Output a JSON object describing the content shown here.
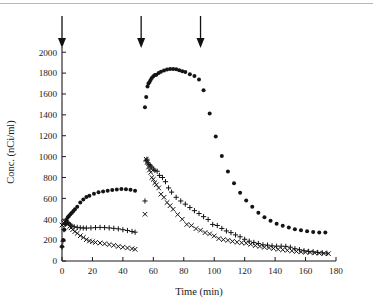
{
  "figure": {
    "kind": "scatter-plot",
    "background_color": "#ffffff",
    "ink_color": "#141414",
    "top_rule_color": "#b8b8b8"
  },
  "chart_data": {
    "type": "scatter",
    "title": "",
    "xlabel": "Time (min)",
    "ylabel": "Conc. (nCi/ml)",
    "xlim": [
      0,
      180
    ],
    "ylim": [
      0,
      2050
    ],
    "xticks": [
      0,
      20,
      40,
      60,
      80,
      100,
      120,
      140,
      160,
      180
    ],
    "yticks": [
      0,
      200,
      400,
      600,
      800,
      1000,
      1200,
      1400,
      1600,
      1800,
      2000
    ],
    "grid": false,
    "legend": "none",
    "annotations": [
      {
        "label": "injection-arrow-1",
        "type": "down-arrow",
        "x": 0
      },
      {
        "label": "injection-arrow-2",
        "type": "down-arrow",
        "x": 52
      },
      {
        "label": "injection-arrow-3",
        "type": "down-arrow",
        "x": 91
      }
    ],
    "series": [
      {
        "name": "filled-circle-series",
        "marker": "filled-circle",
        "points": [
          [
            0,
            140
          ],
          [
            0.8,
            200
          ],
          [
            1.5,
            300
          ],
          [
            2.2,
            355
          ],
          [
            3,
            395
          ],
          [
            3.8,
            420
          ],
          [
            4.6,
            432
          ],
          [
            5.5,
            448
          ],
          [
            6.5,
            462
          ],
          [
            7.5,
            478
          ],
          [
            8.5,
            495
          ],
          [
            10,
            520
          ],
          [
            12,
            560
          ],
          [
            14,
            590
          ],
          [
            16,
            613
          ],
          [
            18,
            625
          ],
          [
            21,
            645
          ],
          [
            24,
            658
          ],
          [
            27,
            665
          ],
          [
            30,
            672
          ],
          [
            33,
            680
          ],
          [
            36,
            686
          ],
          [
            39,
            689
          ],
          [
            42,
            687
          ],
          [
            45,
            682
          ],
          [
            48,
            673
          ],
          [
            54.5,
            1472
          ],
          [
            55.3,
            1572
          ],
          [
            56.2,
            1672
          ],
          [
            56.8,
            1700
          ],
          [
            57.5,
            1715
          ],
          [
            58.2,
            1735
          ],
          [
            59,
            1752
          ],
          [
            60,
            1770
          ],
          [
            61,
            1782
          ],
          [
            62,
            1784
          ],
          [
            63.5,
            1800
          ],
          [
            65,
            1812
          ],
          [
            67,
            1826
          ],
          [
            69,
            1834
          ],
          [
            71,
            1840
          ],
          [
            73,
            1840
          ],
          [
            75,
            1838
          ],
          [
            77,
            1828
          ],
          [
            79,
            1818
          ],
          [
            81,
            1810
          ],
          [
            84,
            1790
          ],
          [
            87,
            1772
          ],
          [
            90,
            1738
          ],
          [
            93,
            1635
          ],
          [
            97,
            1412
          ],
          [
            101,
            1192
          ],
          [
            105,
            1005
          ],
          [
            109,
            858
          ],
          [
            113,
            745
          ],
          [
            117,
            653
          ],
          [
            121,
            580
          ],
          [
            125,
            520
          ],
          [
            129,
            463
          ],
          [
            133,
            420
          ],
          [
            137,
            385
          ],
          [
            141,
            357
          ],
          [
            145,
            338
          ],
          [
            149,
            322
          ],
          [
            153,
            305
          ],
          [
            157,
            295
          ],
          [
            161,
            286
          ],
          [
            165,
            278
          ],
          [
            169,
            272
          ],
          [
            173,
            272
          ]
        ]
      },
      {
        "name": "plus-series",
        "marker": "plus",
        "points": [
          [
            0,
            135
          ],
          [
            0.6,
            190
          ],
          [
            1.3,
            300
          ],
          [
            2,
            350
          ],
          [
            2.8,
            372
          ],
          [
            3.6,
            370
          ],
          [
            4.5,
            358
          ],
          [
            5.5,
            345
          ],
          [
            6.5,
            335
          ],
          [
            8,
            328
          ],
          [
            10,
            322
          ],
          [
            12,
            318
          ],
          [
            14,
            316
          ],
          [
            16,
            315
          ],
          [
            19,
            317
          ],
          [
            22,
            320
          ],
          [
            25,
            322
          ],
          [
            28,
            320
          ],
          [
            31,
            317
          ],
          [
            34,
            313
          ],
          [
            37,
            308
          ],
          [
            40,
            300
          ],
          [
            43,
            292
          ],
          [
            46,
            283
          ],
          [
            48,
            276
          ],
          [
            54.5,
            575
          ],
          [
            55.2,
            960
          ],
          [
            55.8,
            975
          ],
          [
            56.5,
            940
          ],
          [
            57.2,
            925
          ],
          [
            58,
            912
          ],
          [
            59,
            900
          ],
          [
            60,
            880
          ],
          [
            61,
            868
          ],
          [
            62.5,
            860
          ],
          [
            64,
            820
          ],
          [
            66,
            800
          ],
          [
            68,
            760
          ],
          [
            70,
            700
          ],
          [
            72,
            660
          ],
          [
            75,
            610
          ],
          [
            78,
            575
          ],
          [
            81,
            545
          ],
          [
            84,
            512
          ],
          [
            87,
            482
          ],
          [
            90,
            455
          ],
          [
            93,
            425
          ],
          [
            96,
            398
          ],
          [
            99,
            350
          ],
          [
            102,
            340
          ],
          [
            105,
            312
          ],
          [
            108,
            288
          ],
          [
            111,
            272
          ],
          [
            114,
            250
          ],
          [
            117,
            232
          ],
          [
            120,
            208
          ],
          [
            123,
            190
          ],
          [
            126,
            178
          ],
          [
            129,
            168
          ],
          [
            132,
            155
          ],
          [
            135,
            152
          ],
          [
            138,
            145
          ],
          [
            141,
            142
          ],
          [
            144,
            142
          ],
          [
            147,
            140
          ],
          [
            150,
            132
          ],
          [
            153,
            118
          ],
          [
            156,
            108
          ],
          [
            159,
            98
          ],
          [
            162,
            92
          ],
          [
            165,
            88
          ],
          [
            168,
            82
          ],
          [
            171,
            78
          ],
          [
            174,
            75
          ]
        ]
      },
      {
        "name": "cross-series",
        "marker": "cross",
        "points": [
          [
            0,
            345
          ],
          [
            1,
            368
          ],
          [
            2,
            375
          ],
          [
            3,
            368
          ],
          [
            4,
            352
          ],
          [
            5,
            330
          ],
          [
            6,
            318
          ],
          [
            7,
            300
          ],
          [
            8.5,
            282
          ],
          [
            10,
            265
          ],
          [
            12,
            242
          ],
          [
            14,
            225
          ],
          [
            16,
            205
          ],
          [
            18,
            192
          ],
          [
            20,
            185
          ],
          [
            22,
            178
          ],
          [
            25,
            172
          ],
          [
            28,
            165
          ],
          [
            31,
            158
          ],
          [
            34,
            150
          ],
          [
            37,
            140
          ],
          [
            40,
            132
          ],
          [
            43,
            125
          ],
          [
            46,
            118
          ],
          [
            48,
            112
          ],
          [
            54.5,
            448
          ],
          [
            55.3,
            975
          ],
          [
            56,
            945
          ],
          [
            56.8,
            900
          ],
          [
            57.5,
            872
          ],
          [
            58.3,
            850
          ],
          [
            59,
            800
          ],
          [
            60,
            782
          ],
          [
            61,
            750
          ],
          [
            62,
            730
          ],
          [
            63.5,
            700
          ],
          [
            65,
            640
          ],
          [
            67,
            610
          ],
          [
            69,
            560
          ],
          [
            71,
            530
          ],
          [
            73,
            495
          ],
          [
            76,
            445
          ],
          [
            79,
            400
          ],
          [
            82,
            350
          ],
          [
            85,
            340
          ],
          [
            88,
            310
          ],
          [
            91,
            295
          ],
          [
            94,
            272
          ],
          [
            97,
            260
          ],
          [
            100,
            240
          ],
          [
            103,
            215
          ],
          [
            106,
            205
          ],
          [
            109,
            198
          ],
          [
            112,
            188
          ],
          [
            115,
            180
          ],
          [
            118,
            175
          ],
          [
            121,
            170
          ],
          [
            124,
            160
          ],
          [
            127,
            148
          ],
          [
            130,
            140
          ],
          [
            133,
            132
          ],
          [
            136,
            128
          ],
          [
            139,
            120
          ],
          [
            142,
            112
          ],
          [
            145,
            108
          ],
          [
            148,
            102
          ],
          [
            151,
            98
          ],
          [
            154,
            92
          ],
          [
            157,
            88
          ],
          [
            160,
            85
          ],
          [
            163,
            82
          ],
          [
            166,
            78
          ],
          [
            169,
            75
          ],
          [
            172,
            72
          ],
          [
            175,
            70
          ]
        ]
      }
    ]
  }
}
